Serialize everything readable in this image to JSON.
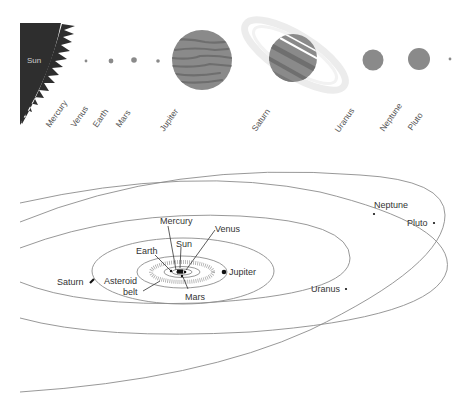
{
  "top_row": {
    "sun_label": "Sun",
    "planets": [
      {
        "name": "Mercury"
      },
      {
        "name": "Venus"
      },
      {
        "name": "Earth"
      },
      {
        "name": "Mars"
      },
      {
        "name": "Jupiter"
      },
      {
        "name": "Saturn"
      },
      {
        "name": "Uranus"
      },
      {
        "name": "Neptune"
      },
      {
        "name": "Pluto"
      }
    ]
  },
  "orbit_diagram": {
    "labels": {
      "mercury": "Mercury",
      "venus": "Venus",
      "sun": "Sun",
      "earth": "Earth",
      "mars": "Mars",
      "jupiter": "Jupiter",
      "asteroid_belt_line1": "Asteroid",
      "asteroid_belt_line2": "belt",
      "saturn": "Saturn",
      "uranus": "Uranus",
      "neptune": "Neptune",
      "pluto": "Pluto"
    }
  },
  "colors": {
    "sun": "#2e2e2e",
    "planet_gray": "#8a8a8a",
    "planet_dark": "#6f6f6f",
    "orbit_line": "#8c8c8c"
  }
}
